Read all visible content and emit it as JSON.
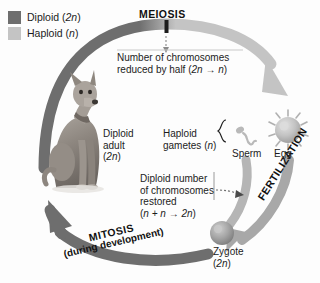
{
  "diagram": {
    "legend": {
      "items": [
        {
          "label_text": "Diploid (",
          "label_italic": "2n",
          "label_tail": ")",
          "color": "#6e6e6e",
          "name": "diploid"
        },
        {
          "label_text": "Haploid (",
          "label_italic": "n",
          "label_tail": ")",
          "color": "#c4c4c4",
          "name": "haploid"
        }
      ]
    },
    "stages": {
      "meiosis": "MEIOSIS",
      "fertilization": "FERTILIZATION",
      "mitosis": "MITOSIS",
      "mitosis_sub": "(during development)"
    },
    "notes": {
      "meiosis_line1": "Number of chromosomes",
      "meiosis_line2_pre": "reduced by half (",
      "meiosis_line2_math": "2n → n",
      "meiosis_line2_post": ")",
      "fertilization_line1": "Diploid number",
      "fertilization_line2": "of chromosomes",
      "fertilization_line3": "restored",
      "fertilization_line4_pre": "(",
      "fertilization_line4_math": "n + n → 2n",
      "fertilization_line4_post": ")"
    },
    "labels": {
      "adult_line1": "Diploid",
      "adult_line2": "adult",
      "adult_line3_pre": "(",
      "adult_line3_math": "2n",
      "adult_line3_post": ")",
      "gametes_line1": "Haploid",
      "gametes_line2_pre": "gametes (",
      "gametes_line2_math": "n",
      "gametes_line2_post": ")",
      "sperm": "Sperm",
      "egg": "Egg",
      "zygote_line1": "Zygote",
      "zygote_line2_pre": "(",
      "zygote_line2_math": "2n",
      "zygote_line2_post": ")"
    },
    "colors": {
      "diploid": "#6e6e6e",
      "haploid": "#c4c4c4",
      "text": "#1c1c1c",
      "background": "#fdfdfd"
    }
  }
}
